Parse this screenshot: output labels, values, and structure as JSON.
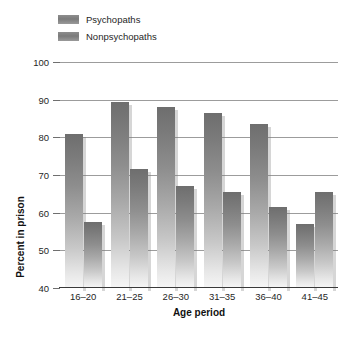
{
  "chart_data": {
    "type": "bar",
    "title": "",
    "xlabel": "Age period",
    "ylabel": "Percent in prison",
    "categories": [
      "16–20",
      "21–25",
      "26–30",
      "31–35",
      "36–40",
      "41–45"
    ],
    "series": [
      {
        "name": "Psychopaths",
        "values": [
          81.0,
          89.5,
          88.0,
          86.5,
          83.5,
          57.0
        ],
        "color": "#808080"
      },
      {
        "name": "Nonpsychopaths",
        "values": [
          57.5,
          71.5,
          67.0,
          65.5,
          61.5,
          65.5
        ],
        "color": "#808080"
      }
    ],
    "ylim": [
      40,
      100
    ],
    "yticks": [
      40,
      50,
      60,
      70,
      80,
      90,
      100
    ],
    "ytick_labels": [
      "40",
      "50",
      "60",
      "70",
      "80",
      "90",
      "100"
    ],
    "grid": true,
    "grid_axis": "y",
    "legend_position": "top-left",
    "bar_style": "vertical-gradient-grayscale",
    "colors": {
      "gridline": "#9c9c9c",
      "axis": "#3a3a3a",
      "text": "#1f1f1f",
      "bar_top": "#6e6e6e",
      "bar_bottom": "#f6f6f6"
    }
  },
  "legend": {
    "items": [
      {
        "label": "Psychopaths",
        "swatch": "psy"
      },
      {
        "label": "Nonpsychopaths",
        "swatch": "nonpsy"
      }
    ]
  },
  "caption": {
    "text": ""
  }
}
